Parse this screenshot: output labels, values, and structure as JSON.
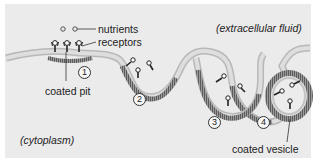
{
  "labels": {
    "nutrients": "nutrients",
    "receptors": "receptors",
    "coated_pit": "coated pit",
    "coated_vesicle": "coated vesicle",
    "extracellular": "(extracellular fluid)",
    "cytoplasm": "(cytoplasm)"
  },
  "steps": [
    "1",
    "2",
    "3",
    "4"
  ],
  "colors": {
    "background": "#ebebeb",
    "membrane": "#c9c9c9",
    "membrane_edge": "#9a9a9a",
    "coat": "#7a7a7a",
    "receptor": "#222222"
  }
}
